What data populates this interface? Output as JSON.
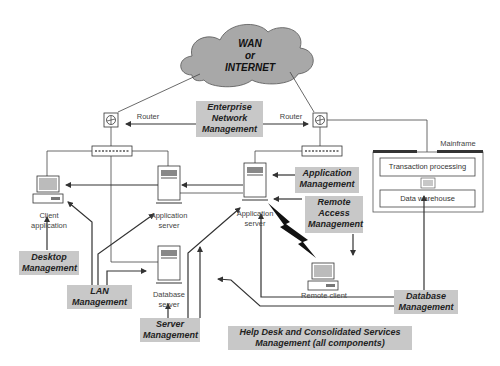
{
  "cloud": {
    "line1": "WAN",
    "line2": "or",
    "line3": "INTERNET"
  },
  "routers": {
    "left_label": "Router",
    "right_label": "Router"
  },
  "nodes": {
    "client": {
      "line1": "Client",
      "line2": "application"
    },
    "app_server_left": {
      "line1": "Application",
      "line2": "server"
    },
    "app_server_right": {
      "line1": "Application",
      "line2": "server"
    },
    "db_server": {
      "line1": "Database",
      "line2": "server"
    },
    "remote_client": {
      "line1": "Remote client"
    },
    "mainframe": {
      "label": "Mainframe",
      "box1": "Transaction processing",
      "box2": "Data warehouse"
    }
  },
  "management": {
    "enterprise": {
      "line1": "Enterprise",
      "line2": "Network",
      "line3": "Management"
    },
    "application": {
      "line1": "Application",
      "line2": "Management"
    },
    "remote_access": {
      "line1": "Remote",
      "line2": "Access",
      "line3": "Management"
    },
    "desktop": {
      "line1": "Desktop",
      "line2": "Management"
    },
    "lan": {
      "line1": "LAN",
      "line2": "Management"
    },
    "server": {
      "line1": "Server",
      "line2": "Management"
    },
    "database": {
      "line1": "Database",
      "line2": "Management"
    },
    "helpdesk": {
      "line1": "Help Desk and Consolidated Services",
      "line2": "Management (all components)"
    }
  },
  "colors": {
    "cloud_fill": "#a8a8a8",
    "mgmt_fill": "#c8c8c8",
    "line": "#333333"
  }
}
